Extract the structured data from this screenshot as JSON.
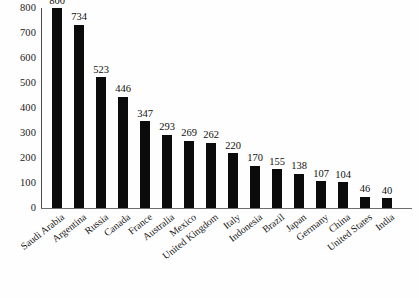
{
  "chart_data": {
    "type": "bar",
    "title": "",
    "subtitle": "",
    "xlabel": "",
    "ylabel": "",
    "ylim": [
      0,
      800
    ],
    "yticks": [
      0,
      100,
      200,
      300,
      400,
      500,
      600,
      700,
      800
    ],
    "grid": false,
    "legend": null,
    "orientation": "vertical",
    "bar_color": "#0b0b0b",
    "background_color": "#ffffff",
    "axis_color": "#4a4a4a",
    "show_value_labels": true,
    "category_label_rotation": -38,
    "categories": [
      "Saudi Arabia",
      "Argentina",
      "Russia",
      "Canada",
      "France",
      "Australia",
      "Mexico",
      "United Kingdom",
      "Italy",
      "Indonesia",
      "Brazil",
      "Japan",
      "Germany",
      "China",
      "United States",
      "India"
    ],
    "values": [
      800,
      734,
      523,
      446,
      347,
      293,
      269,
      262,
      220,
      170,
      155,
      138,
      107,
      104,
      46,
      40
    ],
    "series": [
      {
        "name": "",
        "values": [
          800,
          734,
          523,
          446,
          347,
          293,
          269,
          262,
          220,
          170,
          155,
          138,
          107,
          104,
          46,
          40
        ]
      }
    ]
  }
}
